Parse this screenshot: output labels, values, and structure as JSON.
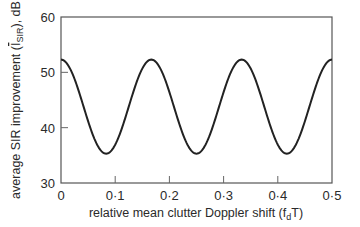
{
  "chart_data": {
    "type": "line",
    "title": "",
    "xlabel": "relative mean clutter Doppler shift (f",
    "xlabel_sub": "d",
    "xlabel_end": "T)",
    "ylabel_prefix": "average SIR improvement (",
    "ylabel_var": "I",
    "ylabel_sub": "SIR",
    "ylabel_suffix": "), dB",
    "xlim": [
      0,
      0.5
    ],
    "ylim": [
      30,
      60
    ],
    "x_ticks": [
      0,
      0.1,
      0.2,
      0.3,
      0.4,
      0.5
    ],
    "x_tick_labels": [
      "0",
      "0·1",
      "0·2",
      "0·3",
      "0·4",
      "0·5"
    ],
    "y_ticks": [
      30,
      40,
      50,
      60
    ],
    "y_tick_labels": [
      "30",
      "40",
      "50",
      "60"
    ],
    "grid": false,
    "legend": null,
    "series": [
      {
        "name": "average SIR improvement",
        "color": "#222222",
        "x": [
          0,
          0.02,
          0.04,
          0.0625,
          0.0833,
          0.104,
          0.125,
          0.145,
          0.1667,
          0.1875,
          0.2083,
          0.229,
          0.25,
          0.271,
          0.2917,
          0.3125,
          0.3333,
          0.354,
          0.375,
          0.396,
          0.4167,
          0.4375,
          0.4583,
          0.479,
          0.5
        ],
        "values": [
          52.3,
          49.8,
          43.8,
          37.8,
          35.3,
          37.8,
          43.8,
          49.8,
          52.3,
          49.8,
          43.8,
          37.8,
          35.3,
          37.8,
          43.8,
          49.8,
          52.3,
          49.8,
          43.8,
          37.8,
          35.3,
          37.8,
          43.8,
          49.8,
          52.3
        ]
      }
    ],
    "model": {
      "mean": 43.8,
      "amplitude": 8.5,
      "period": 0.16667,
      "phase_peak_at": 0
    }
  }
}
